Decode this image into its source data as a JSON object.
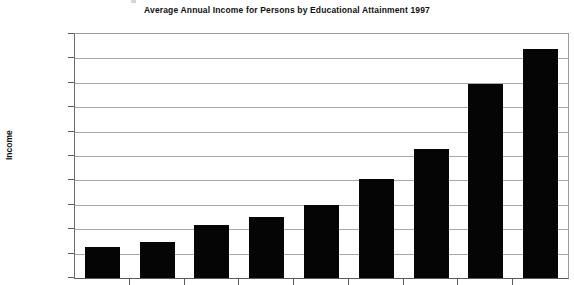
{
  "chart_data": {
    "type": "bar",
    "title": "Average Annual Income for Persons by Educational Attainment 1997",
    "xlabel": "",
    "ylabel": "Income",
    "ylim": [
      0,
      100000
    ],
    "ytick_labels": [
      "$100,000",
      "$90,000",
      "$80,000",
      "$70,000",
      "$60,000",
      "$50,000",
      "$40,000",
      "$30,000",
      "$20,000",
      "$10,000",
      "$0"
    ],
    "ytick_values": [
      100000,
      90000,
      80000,
      70000,
      60000,
      50000,
      40000,
      30000,
      20000,
      10000,
      0
    ],
    "grid": true,
    "legend": false,
    "categories": [
      "",
      "",
      "",
      "",
      "",
      "",
      "",
      "",
      ""
    ],
    "values": [
      12884,
      14920,
      21680,
      24916,
      29749,
      40695,
      52771,
      79346,
      93714
    ],
    "data_labels": [
      "$12,884",
      "$14,920",
      "$21,680",
      "$24,916",
      "$29,749",
      "$40,695",
      "$52,771",
      "$79,346",
      "$93,714"
    ],
    "bar_color": "#050505",
    "gridline_color": "#a8a8a8",
    "note": "x-axis category labels are cropped off the bottom edge of the screenshot"
  }
}
